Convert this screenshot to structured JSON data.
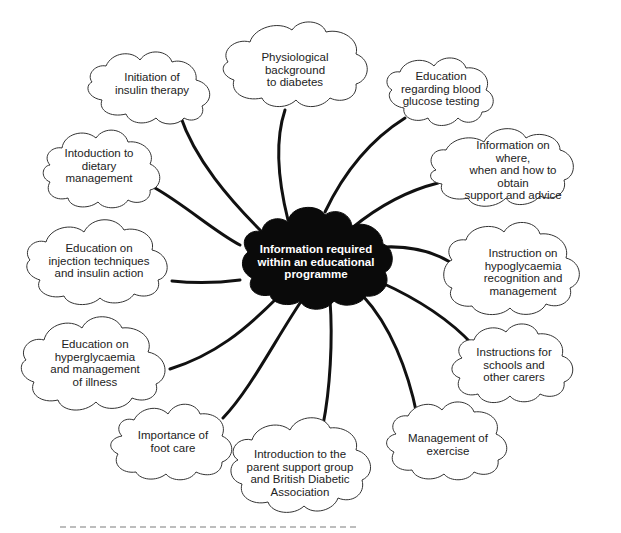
{
  "diagram": {
    "type": "mind-map",
    "colors": {
      "center_fill": "#0a0a0a",
      "center_text": "#ffffff",
      "node_fill": "#ffffff",
      "node_stroke": "#333333",
      "connector": "#111111",
      "text": "#222222"
    },
    "center": {
      "label": "Information required\nwithin an educational\nprogramme"
    },
    "nodes": [
      {
        "id": "insulin-therapy",
        "label": "Initiation of\ninsulin therapy"
      },
      {
        "id": "physiological-background",
        "label": "Physiological\nbackground\nto diabetes"
      },
      {
        "id": "blood-glucose-testing",
        "label": "Education\nregarding blood\nglucose testing"
      },
      {
        "id": "support-advice",
        "label": "Information on where,\nwhen and how to obtain\nsupport and advice"
      },
      {
        "id": "dietary-management",
        "label": "Intoduction to\ndietary\nmanagement"
      },
      {
        "id": "injection-techniques",
        "label": "Education on\ninjection techniques\nand insulin action"
      },
      {
        "id": "hypoglycaemia",
        "label": "Instruction on\nhypoglycaemia\nrecognition and\nmanagement"
      },
      {
        "id": "hyperglycaemia",
        "label": "Education on\nhyperglycaemia\nand management\nof illness"
      },
      {
        "id": "schools-carers",
        "label": "Instructions for\nschools and\nother carers"
      },
      {
        "id": "foot-care",
        "label": "Importance of\nfoot care"
      },
      {
        "id": "parent-support",
        "label": "Introduction to the\nparent support group\nand British Diabetic\nAssociation"
      },
      {
        "id": "exercise",
        "label": "Management  of\nexercise"
      }
    ]
  }
}
